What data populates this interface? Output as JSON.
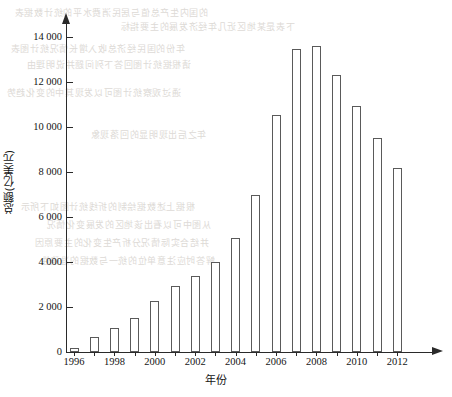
{
  "chart_data": {
    "type": "bar",
    "title": "",
    "xlabel": "年份",
    "ylabel": "总额(亿美元)",
    "categories": [
      1996,
      1997,
      1998,
      1999,
      2000,
      2001,
      2002,
      2003,
      2004,
      2005,
      2006,
      2007,
      2008,
      2009,
      2010,
      2011,
      2012
    ],
    "values": [
      180,
      650,
      1050,
      1500,
      2250,
      2950,
      3400,
      4000,
      5050,
      7000,
      10550,
      13450,
      13600,
      12300,
      10950,
      9500,
      8200
    ],
    "ylim": [
      0,
      14600
    ],
    "xlim": [
      1995.3,
      2013.6
    ],
    "grid": false,
    "legend": null,
    "y_ticks": [
      0,
      2000,
      4000,
      6000,
      8000,
      10000,
      12000,
      14000
    ],
    "y_tick_labels": [
      "0",
      "2 000",
      "4 000",
      "6 000",
      "8 000",
      "10 000",
      "12 000",
      "14 000"
    ],
    "x_ticks": [
      1996,
      1998,
      2000,
      2002,
      2004,
      2006,
      2008,
      2010,
      2012
    ],
    "x_tick_labels": [
      "1996",
      "1998",
      "2000",
      "2002",
      "2004",
      "2006",
      "2008",
      "2010",
      "2012"
    ],
    "bar_style": {
      "fill": "#ffffff",
      "edge": "#5a5a5a"
    },
    "axis_color": "#2a2a2a",
    "axis_arrows": true
  },
  "bleed_through": {
    "note": "faint mirrored text showing through from reverse side of page",
    "color": "#d8d4cf",
    "lines": [
      {
        "text": "的国内生产总值与居民消费水平的统计数据表",
        "x": 14,
        "y": 6
      },
      {
        "text": "下表是某地区近几年经济发展的主要指标",
        "x": 120,
        "y": 20
      },
      {
        "text": "年份的国民经济总收入增长情况统计图表",
        "x": 10,
        "y": 42
      },
      {
        "text": "请根据统计图回答下列问题并说明理由",
        "x": 26,
        "y": 58
      },
      {
        "text": "通过观察统计图可以发现其中的变化趋势",
        "x": 6,
        "y": 86
      },
      {
        "text": "年之后出现明显的回落现象",
        "x": 90,
        "y": 128
      },
      {
        "text": "根据上述数据绘制的折线统计图如下所示",
        "x": 20,
        "y": 200
      },
      {
        "text": "从图中可以看出该地区的发展变化情况",
        "x": 46,
        "y": 218
      },
      {
        "text": "并结合实际情况分析产生变化的主要原因",
        "x": 34,
        "y": 236
      },
      {
        "text": "解答时应注意单位的统一与数据的准确性",
        "x": 40,
        "y": 254
      }
    ]
  }
}
